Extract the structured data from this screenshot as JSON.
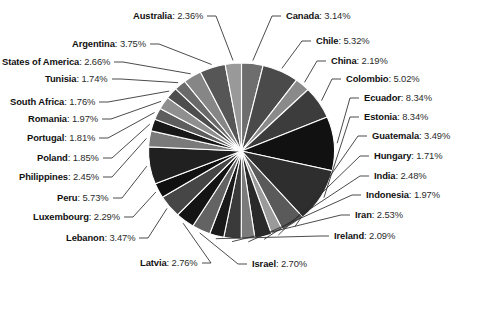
{
  "chart_data": {
    "type": "pie",
    "title": "",
    "unit": "%",
    "legend": "labels-outside",
    "categories": [
      "Canada",
      "Chile",
      "China",
      "Colombio",
      "Ecuador",
      "Estonia",
      "Guatemala",
      "Hungary",
      "India",
      "Indonesia",
      "Iran",
      "Ireland",
      "Israel",
      "Latvia",
      "Lebanon",
      "Luxembourg",
      "Peru",
      "Philippines",
      "Poland",
      "Portugal",
      "Romania",
      "South Africa",
      "Tunisia",
      "States of America",
      "Argentina",
      "Australia"
    ],
    "values": [
      3.14,
      5.32,
      2.19,
      5.02,
      8.34,
      8.34,
      3.49,
      1.71,
      2.48,
      1.97,
      2.53,
      2.09,
      2.7,
      2.76,
      3.47,
      2.29,
      5.73,
      2.45,
      1.85,
      1.81,
      1.97,
      1.76,
      1.74,
      2.66,
      3.75,
      2.36
    ],
    "slices": [
      {
        "name": "Canada",
        "percent": "3.14%",
        "value": 3.14,
        "color": "#6e6e6e"
      },
      {
        "name": "Chile",
        "percent": "5.32%",
        "value": 5.32,
        "color": "#4a4a4a"
      },
      {
        "name": "China",
        "percent": "2.19%",
        "value": 2.19,
        "color": "#8a8a8a"
      },
      {
        "name": "Colombio",
        "percent": "5.02%",
        "value": 5.02,
        "color": "#3c3c3c"
      },
      {
        "name": "Ecuador",
        "percent": "8.34%",
        "value": 8.34,
        "color": "#111111"
      },
      {
        "name": "Estonia",
        "percent": "8.34%",
        "value": 8.34,
        "color": "#2e2e2e"
      },
      {
        "name": "Guatemala",
        "percent": "3.49%",
        "value": 3.49,
        "color": "#5a5a5a"
      },
      {
        "name": "Hungary",
        "percent": "1.71%",
        "value": 1.71,
        "color": "#9a9a9a"
      },
      {
        "name": "India",
        "percent": "2.48%",
        "value": 2.48,
        "color": "#2a2a2a"
      },
      {
        "name": "Indonesia",
        "percent": "1.97%",
        "value": 1.97,
        "color": "#7b7b7b"
      },
      {
        "name": "Iran",
        "percent": "2.53%",
        "value": 2.53,
        "color": "#3a3a3a"
      },
      {
        "name": "Ireland",
        "percent": "2.09%",
        "value": 2.09,
        "color": "#1a1a1a"
      },
      {
        "name": "Israel",
        "percent": "2.70%",
        "value": 2.7,
        "color": "#636363"
      },
      {
        "name": "Latvia",
        "percent": "2.76%",
        "value": 2.76,
        "color": "#141414"
      },
      {
        "name": "Lebanon",
        "percent": "3.47%",
        "value": 3.47,
        "color": "#464646"
      },
      {
        "name": "Luxembourg",
        "percent": "2.29%",
        "value": 2.29,
        "color": "#101010"
      },
      {
        "name": "Peru",
        "percent": "5.73%",
        "value": 5.73,
        "color": "#202020"
      },
      {
        "name": "Philippines",
        "percent": "2.45%",
        "value": 2.45,
        "color": "#7a7a7a"
      },
      {
        "name": "Poland",
        "percent": "1.85%",
        "value": 1.85,
        "color": "#181818"
      },
      {
        "name": "Portugal",
        "percent": "1.81%",
        "value": 1.81,
        "color": "#5e5e5e"
      },
      {
        "name": "Romania",
        "percent": "1.97%",
        "value": 1.97,
        "color": "#8f8f8f"
      },
      {
        "name": "South Africa",
        "percent": "1.76%",
        "value": 1.76,
        "color": "#4e4e4e"
      },
      {
        "name": "Tunisia",
        "percent": "1.74%",
        "value": 1.74,
        "color": "#6a6a6a"
      },
      {
        "name": "States of America",
        "percent": "2.66%",
        "value": 2.66,
        "color": "#868686"
      },
      {
        "name": "Argentina",
        "percent": "3.75%",
        "value": 3.75,
        "color": "#565656"
      },
      {
        "name": "Australia",
        "percent": "2.36%",
        "value": 2.36,
        "color": "#999999"
      }
    ]
  },
  "labels": [
    {
      "name": "Australia",
      "sep": ": ",
      "percent": "2.36%"
    },
    {
      "name": "Argentina",
      "sep": ": ",
      "percent": "3.75%"
    },
    {
      "name": "States of America",
      "sep": ": ",
      "percent": "2.66%"
    },
    {
      "name": "Tunisia",
      "sep": ": ",
      "percent": "1.74%"
    },
    {
      "name": "South Africa",
      "sep": ": ",
      "percent": "1.76%"
    },
    {
      "name": "Romania",
      "sep": ": ",
      "percent": "1.97%"
    },
    {
      "name": "Portugal",
      "sep": ": ",
      "percent": "1.81%"
    },
    {
      "name": "Poland",
      "sep": ": ",
      "percent": "1.85%"
    },
    {
      "name": "Philippines",
      "sep": ": ",
      "percent": "2.45%"
    },
    {
      "name": "Peru",
      "sep": ": ",
      "percent": "5.73%"
    },
    {
      "name": "Luxembourg",
      "sep": ": ",
      "percent": "2.29%"
    },
    {
      "name": "Lebanon",
      "sep": ": ",
      "percent": "3.47%"
    },
    {
      "name": "Latvia",
      "sep": ": ",
      "percent": "2.76%"
    },
    {
      "name": "Israel",
      "sep": ": ",
      "percent": "2.70%"
    },
    {
      "name": "Canada",
      "sep": ": ",
      "percent": "3.14%"
    },
    {
      "name": "Chile",
      "sep": ": ",
      "percent": "5.32%"
    },
    {
      "name": "China",
      "sep": ": ",
      "percent": "2.19%"
    },
    {
      "name": "Colombio",
      "sep": ": ",
      "percent": "5.02%"
    },
    {
      "name": "Ecuador",
      "sep": ": ",
      "percent": "8.34%"
    },
    {
      "name": "Estonia",
      "sep": ": ",
      "percent": "8.34%"
    },
    {
      "name": "Guatemala",
      "sep": ": ",
      "percent": "3.49%"
    },
    {
      "name": "Hungary",
      "sep": ": ",
      "percent": "1.71%"
    },
    {
      "name": "India",
      "sep": ": ",
      "percent": "2.48%"
    },
    {
      "name": "Indonesia",
      "sep": ": ",
      "percent": "1.97%"
    },
    {
      "name": "Iran",
      "sep": ": ",
      "percent": "2.53%"
    },
    {
      "name": "Ireland",
      "sep": ": ",
      "percent": "2.09%"
    }
  ],
  "timeline": {
    "play_icon": "play-icon",
    "selected_year": "2015",
    "years": [
      "2005",
      "2006",
      "2007",
      "2008",
      "2009",
      "2010",
      "2011",
      "2012",
      "2013",
      "2014",
      "2015"
    ]
  },
  "colors": {
    "background": "#ffffff",
    "text": "#1a1a1a",
    "leader_line": "#2b2b2b",
    "year_bar": "#d4d4d4",
    "year_bar_selected": "#1c1c1c"
  }
}
